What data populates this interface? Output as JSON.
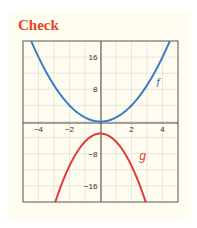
{
  "title": "Check",
  "colors": {
    "f": "#3a7cc8",
    "g": "#e23b3b",
    "title": "#e0452c",
    "panel": "#fffdf0",
    "grid": "#d6d6d6",
    "axis": "#555555"
  },
  "chart_data": {
    "type": "line",
    "title": "Check",
    "xlabel": "",
    "ylabel": "",
    "xlim": [
      -5,
      5
    ],
    "ylim": [
      -20,
      20
    ],
    "grid": true,
    "x_ticks": [
      -4,
      -2,
      2,
      4
    ],
    "y_ticks": [
      16,
      8,
      -8,
      -16
    ],
    "x_tick_labels": [
      "−4",
      "−2",
      "2",
      "4"
    ],
    "y_tick_labels": [
      "16",
      "8",
      "−8",
      "−16"
    ],
    "series": [
      {
        "name": "f",
        "label": "f",
        "formula": "x^2",
        "color": "#3a7cc8",
        "x": [
          -4.47,
          -4,
          -3,
          -2,
          -1,
          0,
          1,
          2,
          3,
          4,
          4.47
        ],
        "y": [
          20,
          16,
          9,
          4,
          1,
          0,
          1,
          4,
          9,
          16,
          20
        ]
      },
      {
        "name": "g",
        "label": "g",
        "formula": "-2x^2 - 3",
        "color": "#e23b3b",
        "x": [
          -2.92,
          -2,
          -1,
          0,
          1,
          2,
          2.92
        ],
        "y": [
          -20,
          -11,
          -5,
          -3,
          -5,
          -11,
          -20
        ]
      }
    ],
    "annotations": [
      {
        "text": "f",
        "x": 3.6,
        "y": 8.5
      },
      {
        "text": "g",
        "x": 2.5,
        "y": -9.5
      }
    ]
  }
}
